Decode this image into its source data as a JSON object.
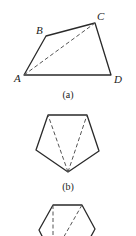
{
  "figure": {
    "panels": [
      {
        "id": "a",
        "caption": "(a)",
        "shape": "quadrilateral",
        "vertices": {
          "A": {
            "label": "A"
          },
          "B": {
            "label": "B"
          },
          "C": {
            "label": "C"
          },
          "D": {
            "label": "D"
          }
        },
        "diagonal": "AC"
      },
      {
        "id": "b",
        "caption": "(b)",
        "shape": "pentagon",
        "diagonals_from_bottom_vertex": 2
      },
      {
        "id": "c",
        "caption": "",
        "shape": "hexagon (partially visible)",
        "diagonals": 2
      }
    ]
  }
}
